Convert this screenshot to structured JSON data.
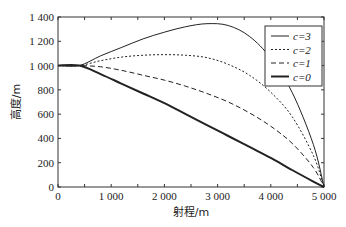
{
  "chart_data": {
    "type": "line",
    "title": "",
    "xlabel": "射程/m",
    "ylabel": "高度/m",
    "xlim": [
      0,
      5000
    ],
    "ylim": [
      0,
      1400
    ],
    "xticks": [
      0,
      1000,
      2000,
      3000,
      4000,
      5000
    ],
    "xtick_labels": [
      "0",
      "1 000",
      "2 000",
      "3 000",
      "4 000",
      "5 000"
    ],
    "yticks": [
      0,
      200,
      400,
      600,
      800,
      1000,
      1200,
      1400
    ],
    "ytick_labels": [
      "0",
      "200",
      "400",
      "600",
      "800",
      "1 000",
      "1 200",
      "1 400"
    ],
    "grid": false,
    "legend_position": "upper right",
    "series": [
      {
        "name": "c=3",
        "style": "solid-thin",
        "x": [
          0,
          400,
          800,
          1200,
          1600,
          2000,
          2400,
          2800,
          3200,
          3600,
          4000,
          4400,
          4800,
          5000
        ],
        "y": [
          1000,
          1000,
          1080,
          1150,
          1220,
          1275,
          1320,
          1345,
          1330,
          1240,
          1060,
          780,
          350,
          0
        ]
      },
      {
        "name": "c=2",
        "style": "dotted",
        "x": [
          0,
          400,
          800,
          1200,
          1600,
          2000,
          2400,
          2800,
          3200,
          3600,
          4000,
          4400,
          4800,
          5000
        ],
        "y": [
          1000,
          1000,
          1040,
          1070,
          1085,
          1090,
          1085,
          1065,
          1010,
          920,
          780,
          580,
          260,
          0
        ]
      },
      {
        "name": "c=1",
        "style": "dashed",
        "x": [
          0,
          400,
          800,
          1200,
          1600,
          2000,
          2400,
          2800,
          3200,
          3600,
          4000,
          4400,
          4800,
          5000
        ],
        "y": [
          1000,
          1000,
          990,
          960,
          920,
          880,
          830,
          770,
          700,
          610,
          500,
          360,
          160,
          0
        ]
      },
      {
        "name": "c=0",
        "style": "solid-thick",
        "x": [
          0,
          400,
          800,
          1200,
          1600,
          2000,
          2400,
          2800,
          3200,
          3600,
          4000,
          4400,
          4800,
          5000
        ],
        "y": [
          1000,
          1000,
          930,
          850,
          770,
          690,
          600,
          510,
          420,
          330,
          240,
          140,
          45,
          0
        ]
      }
    ]
  },
  "legend": {
    "items": [
      {
        "label": "c=3",
        "dash": ""
      },
      {
        "label": "c=2",
        "dash": "2,2"
      },
      {
        "label": "c=1",
        "dash": "5,3"
      },
      {
        "label": "c=0",
        "dash": ""
      }
    ]
  },
  "axes": {
    "xlabel": "射程/m",
    "ylabel": "高度/m"
  }
}
